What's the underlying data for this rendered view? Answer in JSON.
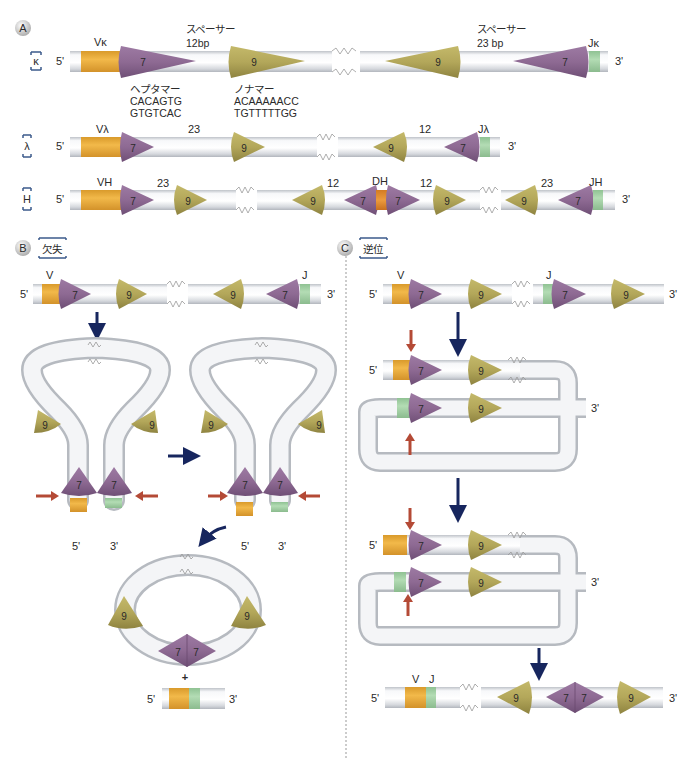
{
  "colors": {
    "heptamer": "#8e6a93",
    "nonamer": "#b3a75a",
    "v_segment": "#e9a93a",
    "j_segment": "#9ccf9f",
    "d_segment": "#e08a2e",
    "dna_tube": "#e6e8ec",
    "arrow_navy": "#17265e",
    "arrow_red": "#b44a36",
    "divider": "#999999"
  },
  "panel_a": {
    "badge": "A",
    "kappa": {
      "locus_label": "κ",
      "five_prime": "5'",
      "three_prime": "3'",
      "v_label": "Vκ",
      "j_label": "Jκ",
      "spacer1_title": "スペーサー",
      "spacer1_len": "12bp",
      "spacer2_title": "スペーサー",
      "spacer2_len": "23 bp",
      "heptamer_title": "ヘプタマー",
      "heptamer_seq1": "CACAGTG",
      "heptamer_seq2": "GTGTCAC",
      "nonamer_title": "ノナマー",
      "nonamer_seq1": "ACAAAAACC",
      "nonamer_seq2": "TGTTTTTGG",
      "hept": "7",
      "non": "9"
    },
    "lambda": {
      "locus_label": "λ",
      "five_prime": "5'",
      "three_prime": "3'",
      "v_label": "Vλ",
      "j_label": "Jλ",
      "spacer1": "23",
      "spacer2": "12",
      "hept": "7",
      "non": "9"
    },
    "heavy": {
      "locus_label": "H",
      "five_prime": "5'",
      "three_prime": "3'",
      "v_label": "VH",
      "d_label": "DH",
      "j_label": "JH",
      "spacers": [
        "23",
        "12",
        "12",
        "23"
      ],
      "hept": "7",
      "non": "9"
    }
  },
  "panel_b": {
    "badge": "B",
    "title": "欠失",
    "v_label": "V",
    "j_label": "J",
    "five_prime": "5'",
    "three_prime": "3'",
    "plus": "+",
    "hept": "7",
    "non": "9"
  },
  "panel_c": {
    "badge": "C",
    "title": "逆位",
    "v_label": "V",
    "j_label": "J",
    "five_prime": "5'",
    "three_prime": "3'",
    "hept": "7",
    "non": "9"
  }
}
